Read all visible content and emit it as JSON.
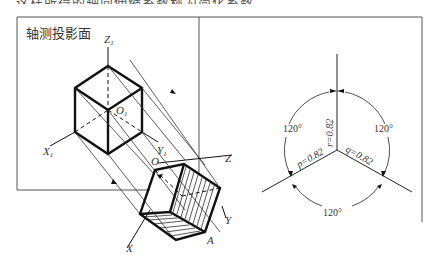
{
  "caption_clipped": "这样所得的轴向伸缩系数称为简化系数。",
  "left_panel": {
    "plane_label": "轴测投影面",
    "axis_labels": {
      "z1": "Z",
      "z1_sub": "1",
      "x1": "X",
      "x1_sub": "1",
      "y1": "Y",
      "y1_sub": "1",
      "o1": "O",
      "o1_sub": "1",
      "o": "O",
      "x": "X",
      "y": "Y",
      "z": "Z",
      "a": "A"
    }
  },
  "right_panel": {
    "angle_top_left": "120°",
    "angle_top_right": "120°",
    "angle_bottom": "120°",
    "coef_r": "r=0.82",
    "coef_p": "p=0.82",
    "coef_q": "q=0.82"
  }
}
